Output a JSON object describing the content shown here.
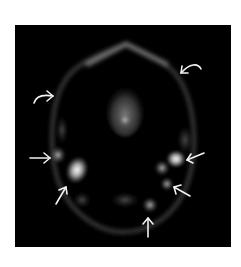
{
  "figure": {
    "background_color": "#ffffff",
    "panel_color": "#000000",
    "arrow_color": "#f2f2f2",
    "panel": {
      "x": 15,
      "y": 25,
      "width": 216,
      "height": 222
    },
    "annotations": {
      "curved_arrows": [
        {
          "id": "curved-arrow-left",
          "direction": "right",
          "tip": [
            53,
            96
          ]
        },
        {
          "id": "curved-arrow-right",
          "direction": "left",
          "tip": [
            181,
            73
          ]
        }
      ],
      "straight_arrows": [
        {
          "id": "arrow-left-mid",
          "direction": "right",
          "tip": [
            50,
            158
          ]
        },
        {
          "id": "arrow-left-lower",
          "direction": "up-right",
          "tip": [
            66,
            187
          ]
        },
        {
          "id": "arrow-right-mid",
          "direction": "left",
          "tip": [
            187,
            160
          ]
        },
        {
          "id": "arrow-right-lower",
          "direction": "up-left",
          "tip": [
            174,
            187
          ]
        },
        {
          "id": "arrow-bottom",
          "direction": "up",
          "tip": [
            148,
            218
          ]
        }
      ]
    },
    "uptake_foci": [
      {
        "x": 77,
        "y": 170,
        "intensity": "high"
      },
      {
        "x": 58,
        "y": 155,
        "intensity": "moderate"
      },
      {
        "x": 176,
        "y": 160,
        "intensity": "high"
      },
      {
        "x": 162,
        "y": 168,
        "intensity": "moderate"
      },
      {
        "x": 166,
        "y": 184,
        "intensity": "moderate"
      },
      {
        "x": 150,
        "y": 205,
        "intensity": "moderate"
      },
      {
        "x": 82,
        "y": 200,
        "intensity": "low"
      },
      {
        "x": 125,
        "y": 200,
        "intensity": "low"
      },
      {
        "x": 125,
        "y": 118,
        "intensity": "moderate"
      }
    ]
  }
}
